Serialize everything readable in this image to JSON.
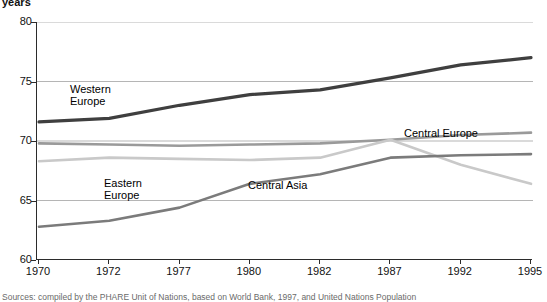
{
  "axis_unit_label": "years",
  "footnote": "Sources: compiled by the PHARE Unit of Nations, based on World Bank, 1997, and United Nations Population",
  "chart_data": {
    "type": "line",
    "title": "",
    "subtitle": "",
    "xlabel": "",
    "ylabel": "years",
    "ylim": [
      60,
      80
    ],
    "yticks": [
      60,
      65,
      70,
      75,
      80
    ],
    "xticks": [
      "1970",
      "1972",
      "1977",
      "1980",
      "1982",
      "1987",
      "1992",
      "1995"
    ],
    "x": [
      1970,
      1972,
      1977,
      1980,
      1982,
      1987,
      1992,
      1995
    ],
    "grid": true,
    "legend": "inline-annotations",
    "series": [
      {
        "name": "Western Europe",
        "label": "Western\nEurope",
        "color": "#3f3f3f",
        "values": [
          71.6,
          71.9,
          73.0,
          73.9,
          74.3,
          75.3,
          76.4,
          77.0
        ]
      },
      {
        "name": "Central Europe",
        "label": "Central Europe",
        "color": "#9a9a9a",
        "values": [
          69.8,
          69.7,
          69.6,
          69.7,
          69.8,
          70.1,
          70.5,
          70.7
        ]
      },
      {
        "name": "Eastern Europe",
        "label": "Eastern\nEurope",
        "color": "#c9c9c9",
        "values": [
          68.3,
          68.6,
          68.5,
          68.4,
          68.6,
          70.1,
          68.0,
          66.4
        ]
      },
      {
        "name": "Central Asia",
        "label": "Central Asia",
        "color": "#7b7b7b",
        "values": [
          62.8,
          63.3,
          64.4,
          66.4,
          67.2,
          68.6,
          68.8,
          68.9
        ]
      }
    ]
  }
}
